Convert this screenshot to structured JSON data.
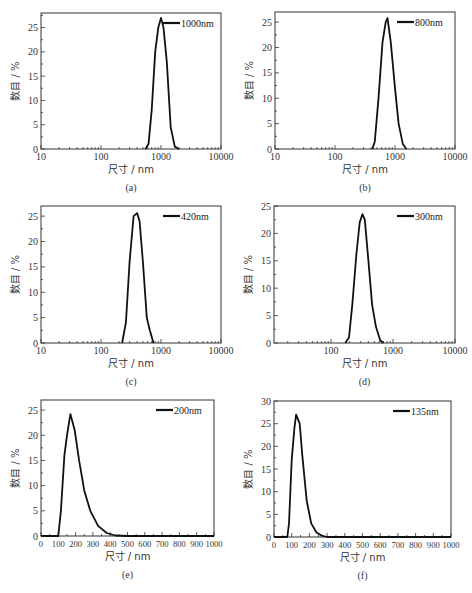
{
  "chart_data": [
    {
      "id": "a",
      "caption": "(a)",
      "type": "line",
      "xscale": "log",
      "xlabel": "尺寸 / nm",
      "ylabel": "数目 / %",
      "xlim": [
        10,
        10000
      ],
      "ylim": [
        0,
        28
      ],
      "xticks": [
        10,
        100,
        1000,
        10000
      ],
      "xtick_labels": [
        "10",
        "100",
        "1000",
        "10000"
      ],
      "yticks": [
        0,
        5,
        10,
        15,
        20,
        25
      ],
      "legend": "1000nm",
      "legend_position": "upper right",
      "series": [
        {
          "name": "1000nm",
          "x": [
            550,
            620,
            700,
            800,
            900,
            1000,
            1100,
            1250,
            1450,
            1700,
            2000
          ],
          "y": [
            0,
            1,
            8,
            20,
            25,
            27,
            25,
            18,
            4.5,
            0.5,
            0
          ]
        }
      ]
    },
    {
      "id": "b",
      "caption": "(b)",
      "type": "line",
      "xscale": "log",
      "xlabel": "尺寸 / nm",
      "ylabel": "数目 / %",
      "xlim": [
        10,
        10000
      ],
      "ylim": [
        0,
        27
      ],
      "xticks": [
        10,
        100,
        1000,
        10000
      ],
      "xtick_labels": [
        "10",
        "100",
        "1000",
        "10000"
      ],
      "yticks": [
        0,
        5,
        10,
        15,
        20,
        25
      ],
      "legend": "800nm",
      "legend_position": "upper right",
      "series": [
        {
          "name": "800nm",
          "x": [
            420,
            460,
            530,
            620,
            700,
            750,
            850,
            1000,
            1150,
            1350,
            1550
          ],
          "y": [
            0,
            1.5,
            10,
            21,
            25,
            25.8,
            21,
            12,
            5,
            1,
            0
          ]
        }
      ]
    },
    {
      "id": "c",
      "caption": "(c)",
      "type": "line",
      "xscale": "log",
      "xlabel": "尺寸 / nm",
      "ylabel": "数目 / %",
      "xlim": [
        10,
        10000
      ],
      "ylim": [
        0,
        27
      ],
      "xticks": [
        10,
        100,
        1000,
        10000
      ],
      "xtick_labels": [
        "10",
        "100",
        "1000",
        "10000"
      ],
      "yticks": [
        0,
        5,
        10,
        15,
        20,
        25
      ],
      "legend": "420nm",
      "legend_position": "upper right",
      "series": [
        {
          "name": "420nm",
          "x": [
            225,
            260,
            300,
            350,
            400,
            440,
            500,
            580,
            650,
            750
          ],
          "y": [
            0,
            4,
            16,
            25,
            25.6,
            24,
            16,
            5,
            2.5,
            0
          ]
        }
      ]
    },
    {
      "id": "d",
      "caption": "(d)",
      "type": "line",
      "xscale": "log",
      "xlabel": "尺寸 / nm",
      "ylabel": "数目 / %",
      "xlim": [
        12,
        10000
      ],
      "ylim": [
        0,
        25
      ],
      "xticks": [
        100,
        1000,
        10000
      ],
      "xtick_labels": [
        "100",
        "1000",
        "10000"
      ],
      "yticks": [
        0,
        5,
        10,
        15,
        20,
        25
      ],
      "legend": "300nm",
      "legend_position": "upper right",
      "series": [
        {
          "name": "300nm",
          "x": [
            170,
            195,
            220,
            255,
            290,
            320,
            350,
            400,
            460,
            530,
            620,
            700
          ],
          "y": [
            0,
            1,
            7,
            16,
            22,
            23.5,
            22.5,
            15,
            7,
            3,
            0.5,
            0
          ]
        }
      ]
    },
    {
      "id": "e",
      "caption": "(e)",
      "type": "line",
      "xscale": "linear",
      "xlabel": "尺寸 / nm",
      "ylabel": "数目 / %",
      "xlim": [
        0,
        1000
      ],
      "ylim": [
        0,
        27
      ],
      "xticks": [
        0,
        100,
        200,
        300,
        400,
        500,
        600,
        700,
        800,
        900,
        1000
      ],
      "xtick_labels": [
        "0",
        "100",
        "200",
        "300",
        "400",
        "500",
        "600",
        "700",
        "800",
        "900",
        "1000"
      ],
      "yticks": [
        0,
        5,
        10,
        15,
        20,
        25
      ],
      "legend": "200nm",
      "legend_position": "upper right",
      "series": [
        {
          "name": "200nm",
          "x": [
            0,
            100,
            115,
            135,
            150,
            170,
            195,
            220,
            250,
            285,
            330,
            380,
            430,
            500,
            1000
          ],
          "y": [
            0,
            0,
            5,
            16,
            20,
            24.2,
            21,
            15,
            9,
            5,
            2,
            0.6,
            0.1,
            0,
            0
          ]
        }
      ]
    },
    {
      "id": "f",
      "caption": "(f)",
      "type": "line",
      "xscale": "linear",
      "xlabel": "尺寸 / nm",
      "ylabel": "数目 / %",
      "xlim": [
        0,
        1000
      ],
      "ylim": [
        0,
        30
      ],
      "xticks": [
        0,
        100,
        200,
        300,
        400,
        500,
        600,
        700,
        800,
        900,
        1000
      ],
      "xtick_labels": [
        "0",
        "100",
        "200",
        "300",
        "400",
        "500",
        "600",
        "700",
        "800",
        "900",
        "1000"
      ],
      "yticks": [
        0,
        5,
        10,
        15,
        20,
        25,
        30
      ],
      "legend": "135nm",
      "legend_position": "upper right",
      "series": [
        {
          "name": "135nm",
          "x": [
            0,
            75,
            85,
            100,
            115,
            125,
            145,
            160,
            185,
            210,
            240,
            270,
            300,
            1000
          ],
          "y": [
            0,
            0,
            3,
            17,
            24,
            27,
            25,
            18,
            8,
            3,
            1,
            0.3,
            0,
            0
          ]
        }
      ]
    }
  ],
  "layout": {
    "panels": {
      "a": {
        "x0": 41,
        "x1": 221,
        "y0": 13,
        "y1": 149
      },
      "b": {
        "x0": 275,
        "x1": 455,
        "y0": 12,
        "y1": 149
      },
      "c": {
        "x0": 41,
        "x1": 221,
        "y0": 206,
        "y1": 343
      },
      "d": {
        "x0": 274,
        "x1": 455,
        "y0": 206,
        "y1": 343
      },
      "e": {
        "x0": 41,
        "x1": 214,
        "y0": 400,
        "y1": 536
      },
      "f": {
        "x0": 274,
        "x1": 451,
        "y0": 401,
        "y1": 537
      }
    }
  }
}
